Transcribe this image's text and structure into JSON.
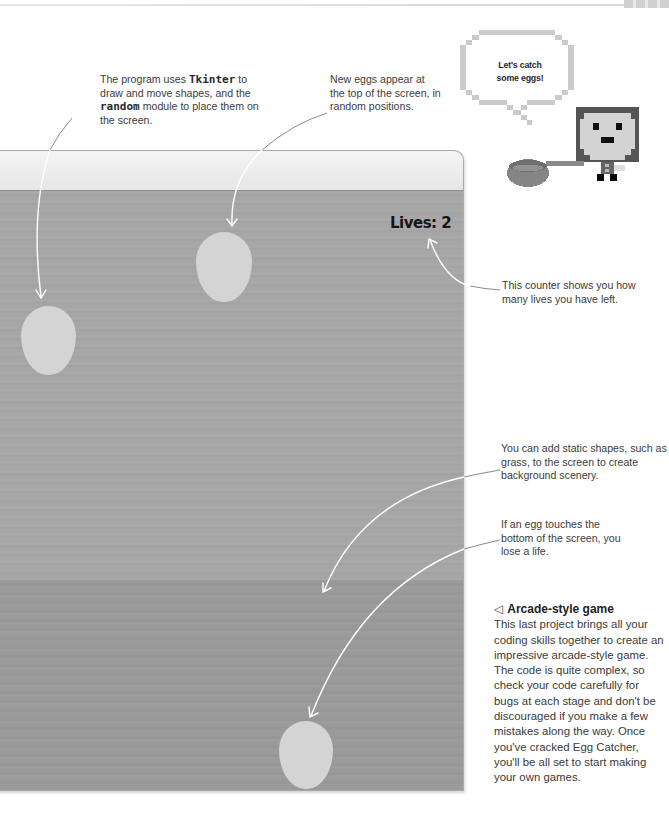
{
  "annotations": {
    "tkinter_random": {
      "prefix": "The program uses ",
      "code1": "Tkinter",
      "mid1": " to draw and move shapes, and the ",
      "code2": "random",
      "suffix": " module to place them on the screen."
    },
    "new_eggs": "New eggs appear at the top of the screen, in random positions.",
    "lives_counter": "This counter shows you how many lives you have left.",
    "static_shapes": "You can add static shapes, such as grass, to the screen to create background scenery.",
    "lose_life": "If an egg touches the bottom of the screen, you lose a life."
  },
  "speech_bubble": {
    "line1": "Let's catch",
    "line2": "some eggs!"
  },
  "game_window": {
    "lives_label": "Lives: 2",
    "eggs": [
      {
        "x": 21,
        "y": 305,
        "w": 55,
        "h": 69
      },
      {
        "x": 196,
        "y": 231,
        "w": 56,
        "h": 70
      },
      {
        "x": 279,
        "y": 720,
        "w": 54,
        "h": 68
      }
    ],
    "colors": {
      "titlebar": "#eeeeee",
      "sky": "#a6a6a6",
      "grass": "#9a9a9a",
      "egg": "#d4d4d4"
    }
  },
  "caption": {
    "icon": "◁",
    "title": "Arcade-style game",
    "body": "This last project brings all your coding skills together to create an impressive arcade-style game. The code is quite complex, so check your code carefully for bugs at each stage and don't be discouraged if you make a few mistakes along the way. Once you've cracked Egg Catcher, you'll be all set to start making your own games."
  }
}
